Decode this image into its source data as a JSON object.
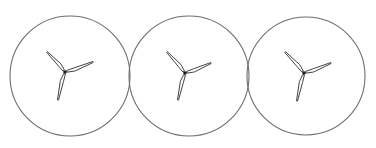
{
  "canvas": {
    "width": 376,
    "height": 148,
    "background": "#ffffff"
  },
  "style": {
    "circle_stroke": "#6e6e6e",
    "circle_stroke_width": 1.1,
    "blade_stroke": "#2e2e2e",
    "blade_fill": "#ffffff",
    "blade_stroke_width": 0.9,
    "hub_color": "#1a1a1a"
  },
  "turbines": [
    {
      "name": "turbine-1",
      "circle": {
        "cx": 70,
        "cy": 76,
        "r": 60
      },
      "hub": {
        "x": 65,
        "y": 72
      },
      "blade_tips": [
        {
          "x": 47,
          "y": 52
        },
        {
          "x": 93,
          "y": 62
        },
        {
          "x": 58,
          "y": 100
        }
      ]
    },
    {
      "name": "turbine-2",
      "circle": {
        "cx": 189,
        "cy": 76,
        "r": 60
      },
      "hub": {
        "x": 185,
        "y": 73
      },
      "blade_tips": [
        {
          "x": 167,
          "y": 52
        },
        {
          "x": 211,
          "y": 63
        },
        {
          "x": 178,
          "y": 100
        }
      ]
    },
    {
      "name": "turbine-3",
      "circle": {
        "cx": 306,
        "cy": 76,
        "r": 59
      },
      "hub": {
        "x": 304,
        "y": 73
      },
      "blade_tips": [
        {
          "x": 285,
          "y": 52
        },
        {
          "x": 331,
          "y": 63
        },
        {
          "x": 297,
          "y": 101
        }
      ]
    }
  ]
}
